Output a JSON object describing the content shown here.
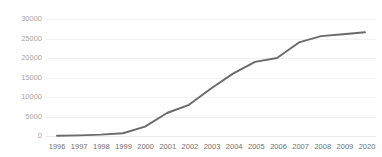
{
  "chart_data": {
    "type": "line",
    "title": "",
    "subtitle": "",
    "xlabel": "",
    "ylabel": "",
    "categories": [
      "1996",
      "1997",
      "1998",
      "1999",
      "2000",
      "2001",
      "2002",
      "2003",
      "2004",
      "2005",
      "2006",
      "2007",
      "2008",
      "2009",
      "2020"
    ],
    "series": [
      {
        "name": "series-1",
        "color": "#6a6a6a",
        "values": [
          50,
          150,
          350,
          700,
          2400,
          5900,
          8000,
          12200,
          16000,
          19000,
          20000,
          24000,
          25600,
          26100,
          26600
        ]
      }
    ],
    "ylim": [
      0,
      30000
    ],
    "y_ticks": [
      0,
      5000,
      10000,
      15000,
      20000,
      25000,
      30000
    ],
    "y_tick_labels": [
      "0",
      "5000",
      "10000",
      "15000",
      "20000",
      "25000",
      "30000"
    ],
    "grid": {
      "horizontal": true,
      "vertical": false,
      "color": "#f2f2f4"
    },
    "legend": {
      "visible": false,
      "position": "none",
      "entries": []
    },
    "annotations": []
  }
}
